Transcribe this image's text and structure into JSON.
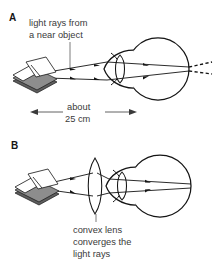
{
  "figure": {
    "background_color": "#ffffff",
    "ink_color": "#141414",
    "text_color": "#3a3a3a",
    "width": 217,
    "height": 261
  },
  "panel_a": {
    "letter": "A",
    "caption_line_1": "light rays from",
    "caption_line_2": "a near object",
    "measure_line_1": "about",
    "measure_line_2": "25 cm",
    "object_name": "open-book",
    "eye_name": "human-eye",
    "ray_count": 2,
    "dashed_ray_note": "rays converge behind the retina"
  },
  "panel_b": {
    "letter": "B",
    "caption_line_1": "convex lens",
    "caption_line_2": "converges the",
    "caption_line_3": "light rays",
    "object_name": "open-book",
    "lens_name": "convex-lens",
    "eye_name": "human-eye",
    "ray_count": 2
  }
}
